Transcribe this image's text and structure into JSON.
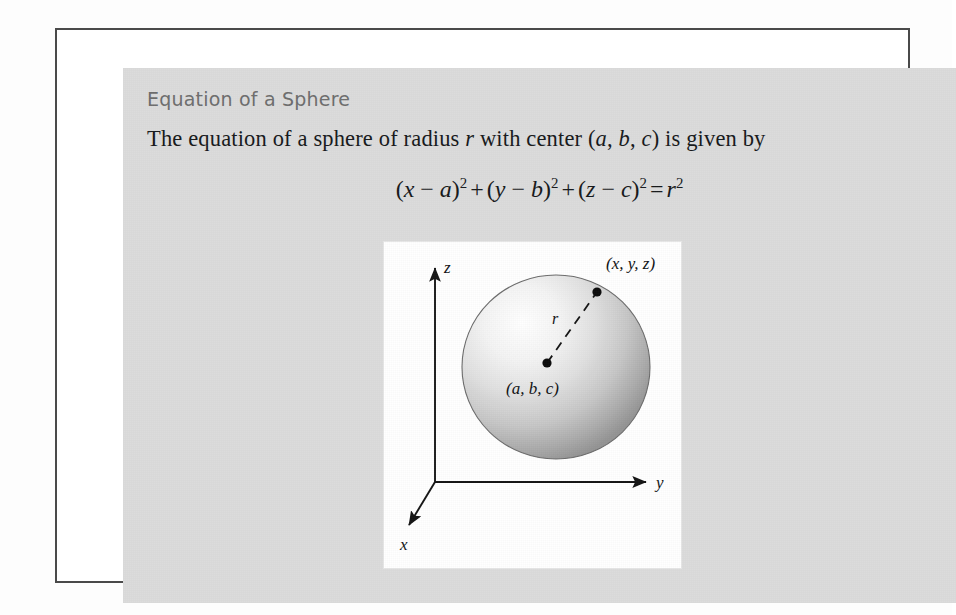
{
  "heading": "Equation of a Sphere",
  "statement": {
    "part1": "The equation of a sphere of radius ",
    "var_r": "r",
    "part2": " with center (",
    "var_a": "a",
    "sep1": ", ",
    "var_b": "b",
    "sep2": ", ",
    "var_c": "c",
    "part3": ") is given by",
    "full_text": "The equation of a sphere of radius r with center (a, b, c) is given by"
  },
  "equation": {
    "full_text": "(x - a)^2 + (y - b)^2 + (z - c)^2 = r^2",
    "term1": {
      "open": "(",
      "var1": "x",
      "minus": " − ",
      "var2": "a",
      "close": ")",
      "exp": "2"
    },
    "plus1": "+",
    "term2": {
      "open": "(",
      "var1": "y",
      "minus": " − ",
      "var2": "b",
      "close": ")",
      "exp": "2"
    },
    "plus2": "+",
    "term3": {
      "open": "(",
      "var1": "z",
      "minus": " − ",
      "var2": "c",
      "close": ")",
      "exp": "2"
    },
    "equals": "=",
    "rhs": {
      "var": "r",
      "exp": "2"
    }
  },
  "figure": {
    "caption_point": "(x, y, z)",
    "caption_center": "(a, b, c)",
    "radius_label": "r",
    "axis_x": "x",
    "axis_y": "y",
    "axis_z": "z"
  },
  "colors": {
    "frame": "#4a4a4a",
    "panel": "#dcdcdc",
    "heading": "#6d6d6d",
    "text": "#16181a",
    "figure_bg": "#ffffff",
    "sphere_highlight": "#ffffff",
    "sphere_mid": "#d2d2d2",
    "sphere_shadow": "#909090",
    "sphere_outline": "#5a5a5a",
    "axis": "#141414"
  }
}
